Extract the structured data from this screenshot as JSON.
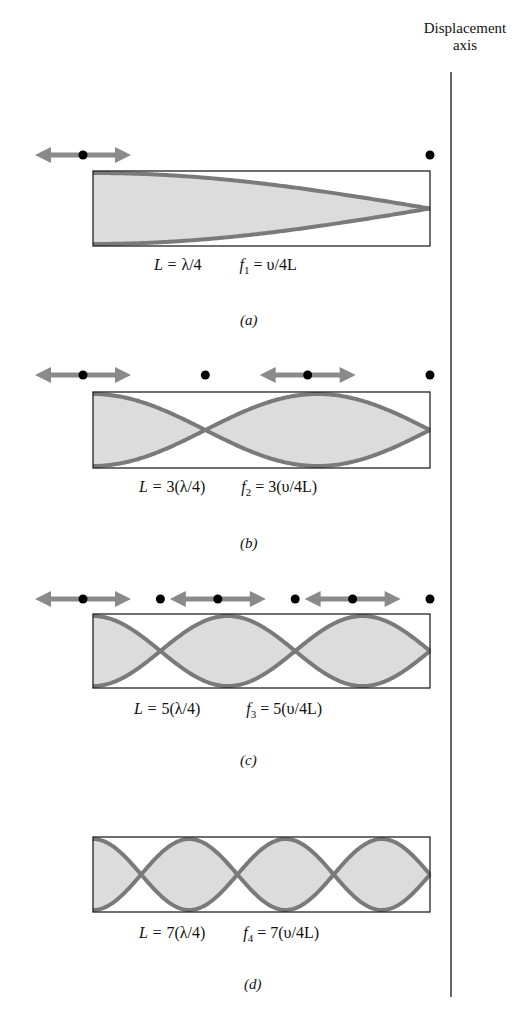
{
  "axis": {
    "title_line1": "Displacement",
    "title_line2": "axis"
  },
  "panels": [
    {
      "id": "a",
      "caption": "(a)",
      "L_prefix": "L = ",
      "L_value": "λ/4",
      "f_prefix": "f",
      "f_sub": "1",
      "f_value": " = υ/4L",
      "loops": 1,
      "box_top": 171,
      "box_bottom": 246,
      "arrow_y": 155
    },
    {
      "id": "b",
      "caption": "(b)",
      "L_prefix": "L = ",
      "L_value": "3(λ/4)",
      "f_prefix": "f",
      "f_sub": "2",
      "f_value": " = 3(υ/4L)",
      "loops": 3,
      "box_top": 392,
      "box_bottom": 468,
      "arrow_y": 375
    },
    {
      "id": "c",
      "caption": "(c)",
      "L_prefix": "L = ",
      "L_value": "5(λ/4)",
      "f_prefix": "f",
      "f_sub": "3",
      "f_value": " = 5(υ/4L)",
      "loops": 5,
      "box_top": 614,
      "box_bottom": 688,
      "arrow_y": 599
    },
    {
      "id": "d",
      "caption": "(d)",
      "L_prefix": "L = ",
      "L_value": "7(λ/4)",
      "f_prefix": "f",
      "f_sub": "4",
      "f_value": " = 7(υ/4L)",
      "loops": 7,
      "box_top": 837,
      "box_bottom": 912,
      "arrow_y": null
    }
  ],
  "colors": {
    "wave": "#7a7a7a",
    "fill": "#dcdcdc",
    "arrow": "#8a8a8a",
    "dot": "#000000",
    "box": "#222222"
  }
}
